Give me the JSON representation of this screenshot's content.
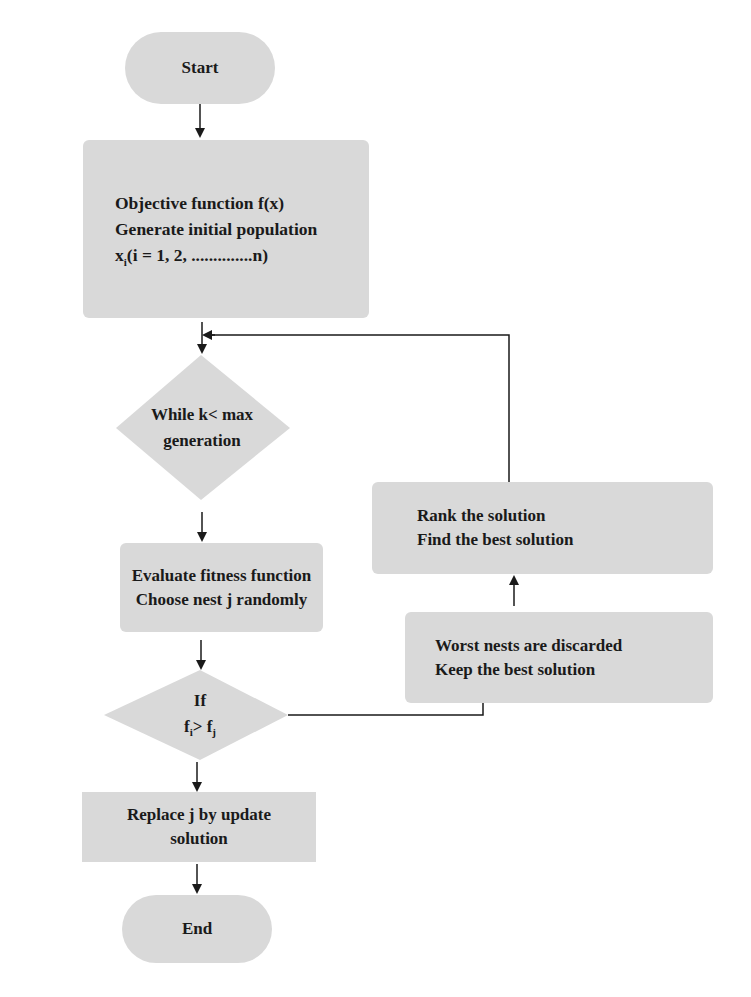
{
  "diagram": {
    "colors": {
      "node_fill": "#d9d9d9",
      "line": "#1a1a1a",
      "background": "#ffffff"
    },
    "nodes": {
      "start": {
        "shape": "terminator",
        "label": "Start"
      },
      "init": {
        "shape": "process",
        "lines": [
          "Objective function f(x)",
          "Generate initial population"
        ],
        "population_prefix": "x",
        "population_sub": "i",
        "population_rest": "(i = 1,  2, ..............n)"
      },
      "while": {
        "shape": "decision",
        "lines": [
          "While k< max",
          "generation"
        ]
      },
      "evaluate": {
        "shape": "process",
        "lines": [
          "Evaluate fitness function",
          "Choose nest j randomly"
        ]
      },
      "if": {
        "shape": "decision",
        "line1": "If",
        "lhs": "f",
        "lhs_sub": "i",
        "op": ">",
        "rhs": "f",
        "rhs_sub": "j"
      },
      "replace": {
        "shape": "process",
        "lines": [
          "Replace j by update",
          "solution"
        ]
      },
      "end": {
        "shape": "terminator",
        "label": "End"
      },
      "worst": {
        "shape": "process",
        "lines": [
          "Worst nests are discarded",
          "Keep the best solution"
        ]
      },
      "rank": {
        "shape": "process",
        "lines": [
          "Rank the solution",
          "Find the best solution"
        ]
      }
    },
    "edges": [
      {
        "from": "start",
        "to": "init"
      },
      {
        "from": "init",
        "to": "while"
      },
      {
        "from": "while",
        "to": "evaluate"
      },
      {
        "from": "evaluate",
        "to": "if"
      },
      {
        "from": "if",
        "to": "replace"
      },
      {
        "from": "replace",
        "to": "end"
      },
      {
        "from": "if",
        "to": "worst"
      },
      {
        "from": "worst",
        "to": "rank"
      },
      {
        "from": "rank",
        "to": "while"
      }
    ]
  }
}
